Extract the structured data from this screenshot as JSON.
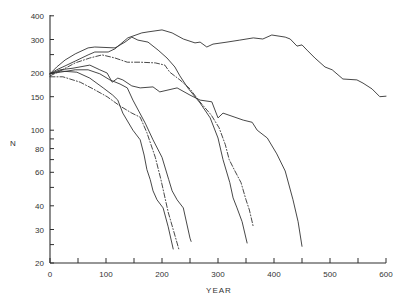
{
  "chart_data": {
    "type": "line",
    "title": "",
    "xlabel": "YEAR",
    "ylabel": "N",
    "xlim": [
      0,
      600
    ],
    "ylim": [
      20,
      400
    ],
    "yscale": "log",
    "grid": false,
    "legend": null,
    "xticks": [
      0,
      100,
      200,
      300,
      400,
      500,
      600
    ],
    "xminor_ticks": [
      50,
      150,
      250,
      350,
      450,
      550
    ],
    "yticks": [
      20,
      30,
      40,
      60,
      80,
      100,
      150,
      200,
      300,
      400
    ],
    "yminor_ticks": [
      25,
      50,
      70,
      90,
      250
    ],
    "series": [
      {
        "style": "solid",
        "end_year": 600,
        "points": [
          [
            0,
            198
          ],
          [
            12,
            208
          ],
          [
            27,
            218
          ],
          [
            45,
            231
          ],
          [
            68,
            249
          ],
          [
            80,
            258
          ],
          [
            104,
            258
          ],
          [
            116,
            268
          ],
          [
            139,
            306
          ],
          [
            164,
            325
          ],
          [
            175,
            329
          ],
          [
            200,
            337
          ],
          [
            218,
            325
          ],
          [
            238,
            302
          ],
          [
            259,
            288
          ],
          [
            268,
            291
          ],
          [
            280,
            274
          ],
          [
            291,
            284
          ],
          [
            316,
            291
          ],
          [
            339,
            298
          ],
          [
            363,
            306
          ],
          [
            380,
            302
          ],
          [
            396,
            317
          ],
          [
            420,
            309
          ],
          [
            429,
            302
          ],
          [
            441,
            277
          ],
          [
            450,
            281
          ],
          [
            459,
            264
          ],
          [
            473,
            240
          ],
          [
            491,
            215
          ],
          [
            504,
            208
          ],
          [
            523,
            186
          ],
          [
            548,
            184
          ],
          [
            559,
            177
          ],
          [
            575,
            165
          ],
          [
            589,
            150
          ],
          [
            600,
            151
          ]
        ]
      },
      {
        "style": "solid",
        "end_year": 450,
        "points": [
          [
            0,
            198
          ],
          [
            18,
            208
          ],
          [
            41,
            212
          ],
          [
            71,
            220
          ],
          [
            89,
            208
          ],
          [
            102,
            200
          ],
          [
            111,
            179
          ],
          [
            121,
            188
          ],
          [
            130,
            184
          ],
          [
            146,
            171
          ],
          [
            161,
            167
          ],
          [
            184,
            169
          ],
          [
            196,
            159
          ],
          [
            227,
            167
          ],
          [
            250,
            153
          ],
          [
            268,
            144
          ],
          [
            289,
            141
          ],
          [
            300,
            116
          ],
          [
            309,
            123
          ],
          [
            345,
            113
          ],
          [
            361,
            110
          ],
          [
            370,
            100
          ],
          [
            388,
            91
          ],
          [
            405,
            75
          ],
          [
            420,
            61
          ],
          [
            434,
            43
          ],
          [
            443,
            33
          ],
          [
            450,
            24.5
          ]
        ]
      },
      {
        "style": "dash-dot",
        "end_year": 363,
        "points": [
          [
            0,
            193
          ],
          [
            18,
            205
          ],
          [
            45,
            226
          ],
          [
            71,
            240
          ],
          [
            93,
            249
          ],
          [
            116,
            240
          ],
          [
            138,
            228
          ],
          [
            161,
            228
          ],
          [
            188,
            226
          ],
          [
            205,
            220
          ],
          [
            214,
            202
          ],
          [
            232,
            184
          ],
          [
            250,
            165
          ],
          [
            265,
            144
          ],
          [
            288,
            120
          ],
          [
            302,
            103
          ],
          [
            313,
            84
          ],
          [
            320,
            70
          ],
          [
            329,
            62
          ],
          [
            341,
            53
          ],
          [
            350,
            43
          ],
          [
            356,
            38
          ],
          [
            363,
            31
          ]
        ]
      },
      {
        "style": "solid",
        "end_year": 352,
        "points": [
          [
            0,
            198
          ],
          [
            12,
            215
          ],
          [
            27,
            234
          ],
          [
            45,
            252
          ],
          [
            68,
            271
          ],
          [
            80,
            274
          ],
          [
            116,
            271
          ],
          [
            134,
            291
          ],
          [
            146,
            309
          ],
          [
            157,
            298
          ],
          [
            175,
            291
          ],
          [
            193,
            264
          ],
          [
            209,
            240
          ],
          [
            223,
            215
          ],
          [
            232,
            193
          ],
          [
            246,
            167
          ],
          [
            268,
            139
          ],
          [
            286,
            116
          ],
          [
            300,
            91
          ],
          [
            309,
            70
          ],
          [
            321,
            53
          ],
          [
            327,
            44
          ],
          [
            334,
            39
          ],
          [
            343,
            33
          ],
          [
            352,
            25.5
          ]
        ]
      },
      {
        "style": "solid",
        "end_year": 252,
        "points": [
          [
            0,
            198
          ],
          [
            18,
            202
          ],
          [
            45,
            208
          ],
          [
            68,
            208
          ],
          [
            89,
            198
          ],
          [
            107,
            184
          ],
          [
            125,
            175
          ],
          [
            138,
            167
          ],
          [
            148,
            144
          ],
          [
            170,
            109
          ],
          [
            184,
            89
          ],
          [
            200,
            72
          ],
          [
            212,
            55
          ],
          [
            218,
            48
          ],
          [
            227,
            43
          ],
          [
            238,
            39
          ],
          [
            250,
            27
          ],
          [
            252,
            26
          ]
        ]
      },
      {
        "style": "dash-dot",
        "end_year": 230,
        "points": [
          [
            0,
            191
          ],
          [
            23,
            191
          ],
          [
            54,
            179
          ],
          [
            77,
            165
          ],
          [
            102,
            150
          ],
          [
            125,
            134
          ],
          [
            146,
            123
          ],
          [
            161,
            117
          ],
          [
            173,
            97
          ],
          [
            188,
            72
          ],
          [
            198,
            55
          ],
          [
            211,
            37
          ],
          [
            220,
            30
          ],
          [
            230,
            23.7
          ]
        ]
      },
      {
        "style": "solid",
        "end_year": 220,
        "points": [
          [
            0,
            198
          ],
          [
            18,
            205
          ],
          [
            48,
            202
          ],
          [
            71,
            188
          ],
          [
            95,
            167
          ],
          [
            112,
            153
          ],
          [
            121,
            144
          ],
          [
            130,
            123
          ],
          [
            148,
            100
          ],
          [
            161,
            89
          ],
          [
            168,
            74
          ],
          [
            173,
            62
          ],
          [
            179,
            55
          ],
          [
            184,
            48
          ],
          [
            191,
            43
          ],
          [
            202,
            39
          ],
          [
            211,
            31
          ],
          [
            220,
            23.7
          ]
        ]
      }
    ]
  },
  "axes": {
    "x_title": "YEAR",
    "y_title": "N"
  }
}
